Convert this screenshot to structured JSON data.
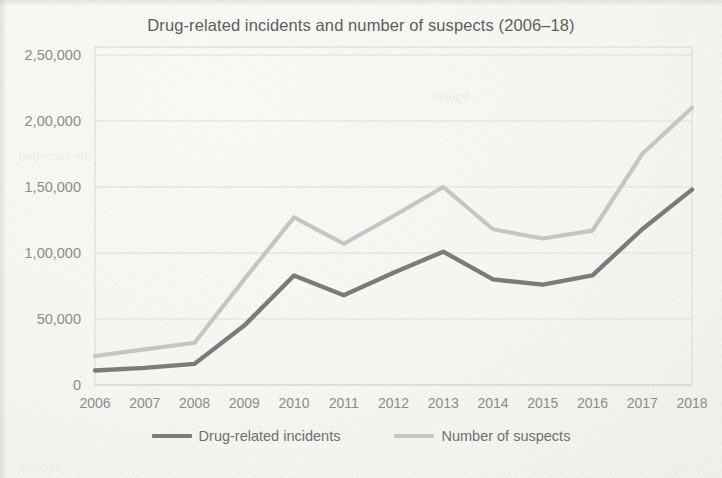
{
  "page": {
    "background_color": "#fbfbf8",
    "ghost_texts": [
      "the recorded",
      "figures",
      "section"
    ]
  },
  "chart_title": "Drug-related incidents and number of suspects (2006–18)",
  "legend": {
    "items": [
      {
        "label": "Drug-related incidents",
        "color": "#7b7b7b"
      },
      {
        "label": "Number of suspects",
        "color": "#c5c5c5"
      }
    ]
  },
  "axes": {
    "y_tick_labels": [
      "2,50,000",
      "2,00,000",
      "1,50,000",
      "1,00,000",
      "50,000",
      "0"
    ],
    "y_tick_values": [
      250000,
      200000,
      150000,
      100000,
      50000,
      0
    ],
    "x_tick_labels": [
      "2006",
      "2007",
      "2008",
      "2009",
      "2010",
      "2011",
      "2012",
      "2013",
      "2014",
      "2015",
      "2016",
      "2017",
      "2018"
    ]
  },
  "chart_data": {
    "type": "line",
    "title": "Drug-related incidents and number of suspects (2006–18)",
    "xlabel": "",
    "ylabel": "",
    "categories": [
      "2006",
      "2007",
      "2008",
      "2009",
      "2010",
      "2011",
      "2012",
      "2013",
      "2014",
      "2015",
      "2016",
      "2017",
      "2018"
    ],
    "series": [
      {
        "name": "Drug-related incidents",
        "color": "#7b7b7b",
        "values": [
          11000,
          13000,
          16000,
          45000,
          83000,
          68000,
          85000,
          101000,
          80000,
          76000,
          83000,
          118000,
          148000
        ]
      },
      {
        "name": "Number of suspects",
        "color": "#c5c5c5",
        "values": [
          22000,
          27000,
          32000,
          80000,
          127000,
          107000,
          128000,
          150000,
          118000,
          111000,
          117000,
          175000,
          210000
        ]
      }
    ],
    "ylim": [
      0,
      250000
    ],
    "ytick_interval": 50000,
    "grid": true,
    "legend_position": "bottom"
  }
}
